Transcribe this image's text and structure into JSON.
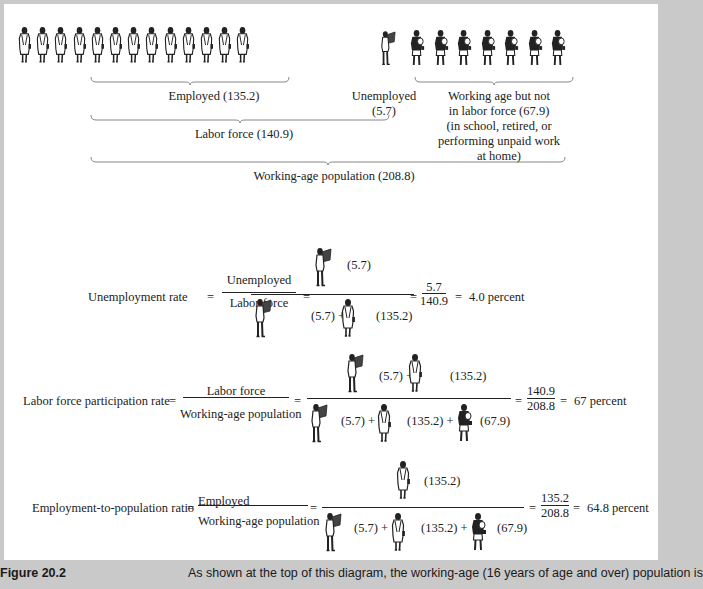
{
  "colors": {
    "frame": "#c9c9c9",
    "panel": "#ffffff",
    "ink": "#222222"
  },
  "top_diagram": {
    "figure_rows": {
      "employed_icons": 13,
      "unemployed_icons": 1,
      "not_in_labor_force_icons": 7
    },
    "labels": {
      "employed": "Employed (135.2)",
      "unemployed_line1": "Unemployed",
      "unemployed_line2": "(5.7)",
      "not_lf_line1": "Working age but not",
      "not_lf_line2": "in labor force (67.9)",
      "not_lf_line3": "(in school, retired, or",
      "not_lf_line4": "performing unpaid work",
      "not_lf_line5": "at home)",
      "labor_force": "Labor force (140.9)",
      "working_age": "Working-age population (208.8)"
    }
  },
  "equations": [
    {
      "name": "Unemployment rate",
      "lhs": "Unemployment rate",
      "eq": "=",
      "frac_num": "Unemployed",
      "frac_den": "Labor force",
      "pict_num": [
        {
          "icon": "unemployed",
          "value": "(5.7)"
        }
      ],
      "pict_den": [
        {
          "icon": "unemployed",
          "value": "(5.7) +"
        },
        {
          "icon": "employed",
          "value": "(135.2)"
        }
      ],
      "result_num": "5.7",
      "result_den": "140.9",
      "result": "4.0 percent"
    },
    {
      "name": "Labor force participation rate",
      "lhs": "Labor force participation rate",
      "eq": "=",
      "frac_num": "Labor force",
      "frac_den": "Working-age population",
      "pict_num": [
        {
          "icon": "unemployed",
          "value": "(5.7) +"
        },
        {
          "icon": "employed",
          "value": "(135.2)"
        }
      ],
      "pict_den": [
        {
          "icon": "unemployed",
          "value": "(5.7) +"
        },
        {
          "icon": "employed",
          "value": "(135.2) +"
        },
        {
          "icon": "not-in-labor-force",
          "value": "(67.9)"
        }
      ],
      "result_num": "140.9",
      "result_den": "208.8",
      "result": "67 percent"
    },
    {
      "name": "Employment-to-population ratio",
      "lhs": "Employment-to-population ratio",
      "eq": "=",
      "frac_num": "Employed",
      "frac_den": "Working-age population",
      "pict_num": [
        {
          "icon": "employed",
          "value": "(135.2)"
        }
      ],
      "pict_den": [
        {
          "icon": "unemployed",
          "value": "(5.7) +"
        },
        {
          "icon": "employed",
          "value": "(135.2) +"
        },
        {
          "icon": "not-in-labor-force",
          "value": "(67.9)"
        }
      ],
      "result_num": "135.2",
      "result_den": "208.8",
      "result": "64.8 percent"
    }
  ],
  "caption": {
    "label": "Figure 20.2",
    "text": "As shown at the top of this diagram, the working-age (16 years of age and over) population is"
  }
}
